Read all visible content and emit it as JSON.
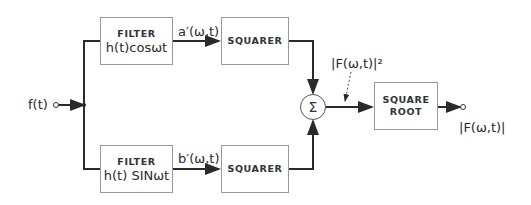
{
  "diagram": {
    "input_label": "f(t)",
    "blocks": {
      "filter_cos": {
        "title": "FILTER",
        "expr": "h(t)cosωt"
      },
      "filter_sin": {
        "title": "FILTER",
        "expr": "h(t) SINωt"
      },
      "squarer_top": {
        "title": "SQUARER"
      },
      "squarer_bottom": {
        "title": "SQUARER"
      },
      "summer": {
        "symbol": "Σ"
      },
      "square_root": {
        "title_line1": "SQUARE",
        "title_line2": "ROOT"
      }
    },
    "signals": {
      "a_prime": "a′(ω,t)",
      "b_prime": "b′(ω,t)",
      "magnitude_squared": "|F(ω,t)|²",
      "magnitude": "|F(ω,t)|"
    },
    "colors": {
      "line": "#2a2a2a",
      "box_border": "#9a9a9a"
    }
  }
}
